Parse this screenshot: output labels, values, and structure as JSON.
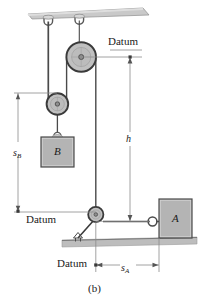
{
  "figure": {
    "caption": "(b)",
    "type": "mechanics-pulley-diagram"
  },
  "labels": {
    "datum_top": "Datum",
    "datum_left": "Datum",
    "datum_bottom": "Datum",
    "block_b": "B",
    "block_a": "A",
    "dim_h": "h",
    "dim_sb_base": "s",
    "dim_sb_sub": "B",
    "dim_sa_base": "s",
    "dim_sa_sub": "A"
  },
  "colors": {
    "ceiling_fill": "#c9c9c9",
    "ground_fill": "#bdbdbd",
    "block_fill": "#b4b4b4",
    "pulley_fill": "#c0c0c0",
    "pulley_hub": "#a8a8a8",
    "line": "#3a3a3a",
    "dim_line": "#8a8a8a",
    "cord": "#4a4a4a",
    "text": "#1a1a1a"
  },
  "elements": {
    "ceiling": "fixed-ceiling-slab",
    "ground": "ground-surface",
    "pulley_upper": "upper-fixed-pulley",
    "pulley_lower": "lower-movable-pulley",
    "pulley_floor": "floor-mounted-pulley",
    "hook_left": "ceiling-hook-left",
    "hook_right": "ceiling-hook-right",
    "cord": "cord-path",
    "strut": "pulley-support-strut"
  }
}
